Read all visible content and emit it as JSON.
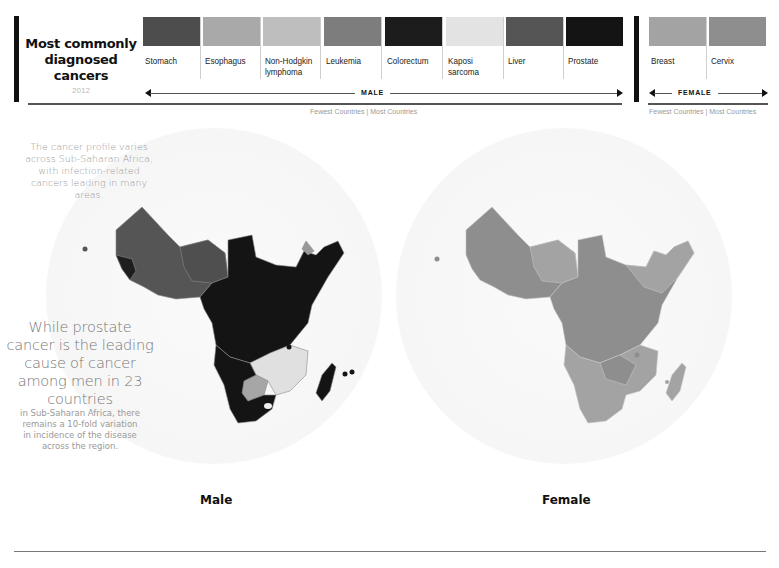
{
  "header": {
    "title": "Most commonly diagnosed cancers",
    "year": "2012"
  },
  "legend": {
    "male": {
      "axis_label": "MALE",
      "scale_note": "Fewest Countries | Most Countries",
      "items": [
        {
          "label": "Stomach",
          "color": "#4d4d4d"
        },
        {
          "label": "Esophagus",
          "color": "#a9a9a9"
        },
        {
          "label": "Non-Hodgkin lymphoma",
          "color": "#bebebe"
        },
        {
          "label": "Leukemia",
          "color": "#7d7d7d"
        },
        {
          "label": "Colorectum",
          "color": "#1c1c1c"
        },
        {
          "label": "Kaposi sarcoma",
          "color": "#e3e3e3"
        },
        {
          "label": "Liver",
          "color": "#555555"
        },
        {
          "label": "Prostate",
          "color": "#141414"
        }
      ]
    },
    "female": {
      "axis_label": "FEMALE",
      "scale_note": "Fewest Countries | Most Countries",
      "items": [
        {
          "label": "Breast",
          "color": "#a3a3a3"
        },
        {
          "label": "Cervix",
          "color": "#8e8e8e"
        }
      ]
    }
  },
  "text": {
    "intro": "The cancer profile varies across Sub-Saharan Africa, with infection-related cancers leading in many areas.",
    "callout_big": "While prostate cancer is the leading cause of cancer among men in 23 countries",
    "callout_small": "in Sub-Saharan Africa, there remains a 10-fold variation in incidence of the disease across the region."
  },
  "maps": {
    "male": {
      "title": "Male"
    },
    "female": {
      "title": "Female"
    }
  }
}
